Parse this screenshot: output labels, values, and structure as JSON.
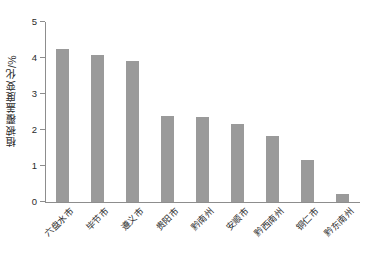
{
  "chart_data": {
    "type": "bar",
    "title": "",
    "xlabel": "",
    "ylabel": "植被覆盖度变化/%",
    "ylim": [
      0,
      5
    ],
    "ytick_labels": [
      "0",
      "1",
      "2",
      "3",
      "4",
      "5"
    ],
    "ytick_values": [
      0,
      1,
      2,
      3,
      4,
      5
    ],
    "grid": false,
    "legend": false,
    "bar_color": "#9a9a9a",
    "axis_color": "#8d8d8d",
    "text_color": "#2b2b2b",
    "background": "#ffffff",
    "categories": [
      "六盘水市",
      "毕节市",
      "遵义市",
      "贵阳市",
      "黔南州",
      "安顺市",
      "黔西南州",
      "铜仁市",
      "黔东南州"
    ],
    "values": [
      4.25,
      4.07,
      3.92,
      2.38,
      2.37,
      2.18,
      1.82,
      1.18,
      0.22
    ]
  }
}
